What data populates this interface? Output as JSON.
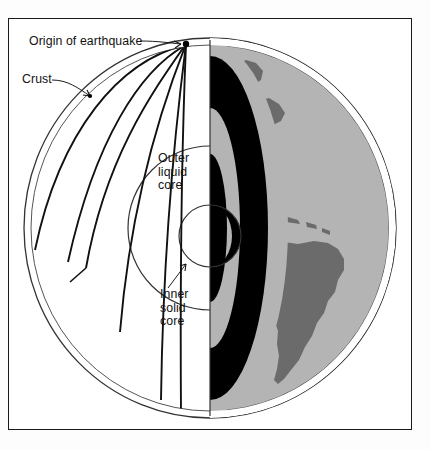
{
  "figure": {
    "frame_border_color": "#1a1a1a",
    "background_color": "#ffffff"
  },
  "labels": {
    "origin": "Origin of earthquake",
    "crust": "Crust",
    "outer_core_line1": "Outer",
    "outer_core_line2": "liquid",
    "outer_core_line3": "core",
    "inner_core_line1": "Inner",
    "inner_core_line2": "solid",
    "inner_core_line3": "core"
  },
  "colors": {
    "ocean_gray": "#b4b4b4",
    "continent_gray": "#6b6b6b",
    "core_black": "#000000",
    "mantle_gray": "#b4b4b4",
    "outline": "#1a1a1a",
    "thin_outline": "#555555",
    "white": "#ffffff"
  },
  "geometry": {
    "globe_center_x": 210,
    "globe_center_y": 228,
    "globe_radius_x": 186,
    "globe_radius_y": 190,
    "crust_inset": 7,
    "outer_core_radius": 82,
    "inner_core_radius": 31
  },
  "structure": {
    "layers": [
      {
        "name": "crust",
        "label": "Crust"
      },
      {
        "name": "mantle",
        "label": "Mantle"
      },
      {
        "name": "outer-liquid-core",
        "label": "Outer liquid core"
      },
      {
        "name": "inner-solid-core",
        "label": "Inner solid core"
      }
    ],
    "ray_count": 6,
    "origin_point": {
      "x": 186,
      "y": 44
    }
  }
}
